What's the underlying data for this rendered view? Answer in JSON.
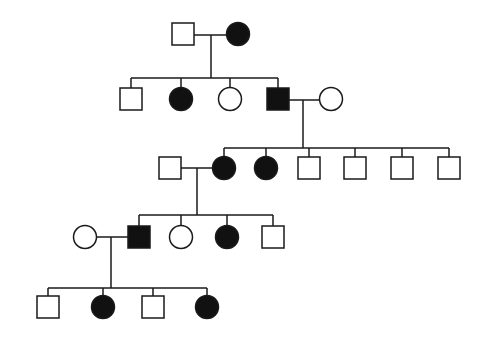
{
  "diagram": {
    "type": "pedigree",
    "colors": {
      "line": "#1a1a1a",
      "affected": "#111111",
      "unaffected": "#ffffff",
      "background": "#ffffff"
    },
    "symbol_size": 22,
    "individuals": [
      {
        "id": "I-1",
        "generation": 1,
        "sex": "male",
        "affected": false,
        "x": 183,
        "y": 34
      },
      {
        "id": "I-2",
        "generation": 1,
        "sex": "female",
        "affected": true,
        "x": 238,
        "y": 34
      },
      {
        "id": "II-1",
        "generation": 2,
        "sex": "male",
        "affected": false,
        "x": 131,
        "y": 99
      },
      {
        "id": "II-2",
        "generation": 2,
        "sex": "female",
        "affected": true,
        "x": 181,
        "y": 99
      },
      {
        "id": "II-3",
        "generation": 2,
        "sex": "female",
        "affected": false,
        "x": 230,
        "y": 99
      },
      {
        "id": "II-4",
        "generation": 2,
        "sex": "male",
        "affected": true,
        "x": 278,
        "y": 99
      },
      {
        "id": "II-5",
        "generation": 2,
        "sex": "female",
        "affected": false,
        "x": 331,
        "y": 99
      },
      {
        "id": "III-1",
        "generation": 3,
        "sex": "male",
        "affected": false,
        "x": 170,
        "y": 168
      },
      {
        "id": "III-2",
        "generation": 3,
        "sex": "female",
        "affected": true,
        "x": 224,
        "y": 168
      },
      {
        "id": "III-3",
        "generation": 3,
        "sex": "female",
        "affected": true,
        "x": 266,
        "y": 168
      },
      {
        "id": "III-4",
        "generation": 3,
        "sex": "male",
        "affected": false,
        "x": 309,
        "y": 168
      },
      {
        "id": "III-5",
        "generation": 3,
        "sex": "male",
        "affected": false,
        "x": 355,
        "y": 168
      },
      {
        "id": "III-6",
        "generation": 3,
        "sex": "male",
        "affected": false,
        "x": 402,
        "y": 168
      },
      {
        "id": "III-7",
        "generation": 3,
        "sex": "male",
        "affected": false,
        "x": 449,
        "y": 168
      },
      {
        "id": "IV-1",
        "generation": 4,
        "sex": "female",
        "affected": false,
        "x": 85,
        "y": 237
      },
      {
        "id": "IV-2",
        "generation": 4,
        "sex": "male",
        "affected": true,
        "x": 139,
        "y": 237
      },
      {
        "id": "IV-3",
        "generation": 4,
        "sex": "female",
        "affected": false,
        "x": 181,
        "y": 237
      },
      {
        "id": "IV-4",
        "generation": 4,
        "sex": "female",
        "affected": true,
        "x": 227,
        "y": 237
      },
      {
        "id": "IV-5",
        "generation": 4,
        "sex": "male",
        "affected": false,
        "x": 273,
        "y": 237
      },
      {
        "id": "V-1",
        "generation": 5,
        "sex": "male",
        "affected": false,
        "x": 48,
        "y": 307
      },
      {
        "id": "V-2",
        "generation": 5,
        "sex": "female",
        "affected": true,
        "x": 103,
        "y": 307
      },
      {
        "id": "V-3",
        "generation": 5,
        "sex": "male",
        "affected": false,
        "x": 153,
        "y": 307
      },
      {
        "id": "V-4",
        "generation": 5,
        "sex": "female",
        "affected": true,
        "x": 207,
        "y": 307
      }
    ],
    "matings": [
      {
        "partners": [
          "I-1",
          "I-2"
        ],
        "y": 35,
        "x1": 194,
        "x2": 227,
        "drop_x": 211,
        "drop_to_y": 78
      },
      {
        "partners": [
          "II-4",
          "II-5"
        ],
        "y": 100,
        "x1": 289,
        "x2": 320,
        "drop_x": 303,
        "drop_to_y": 148
      },
      {
        "partners": [
          "III-1",
          "III-2"
        ],
        "y": 168,
        "x1": 181,
        "x2": 213,
        "drop_x": 197,
        "drop_to_y": 215
      },
      {
        "partners": [
          "IV-1",
          "IV-2"
        ],
        "y": 237,
        "x1": 96,
        "x2": 128,
        "drop_x": 111,
        "drop_to_y": 288
      }
    ],
    "sibships": [
      {
        "parents": "I-1 x I-2",
        "y": 78,
        "x1": 131,
        "x2": 278,
        "children": [
          "II-1",
          "II-2",
          "II-3",
          "II-4"
        ]
      },
      {
        "parents": "II-4 x II-5",
        "y": 148,
        "x1": 224,
        "x2": 449,
        "children": [
          "III-2",
          "III-3",
          "III-4",
          "III-5",
          "III-6",
          "III-7"
        ]
      },
      {
        "parents": "III-1 x III-2",
        "y": 215,
        "x1": 139,
        "x2": 273,
        "children": [
          "IV-2",
          "IV-3",
          "IV-4",
          "IV-5"
        ]
      },
      {
        "parents": "IV-1 x IV-2",
        "y": 288,
        "x1": 48,
        "x2": 207,
        "children": [
          "V-1",
          "V-2",
          "V-3",
          "V-4"
        ]
      }
    ]
  }
}
